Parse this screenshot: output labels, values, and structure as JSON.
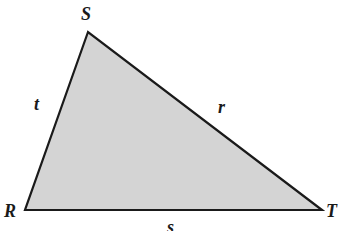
{
  "diagram": {
    "type": "triangle",
    "fill_color": "#d4d4d4",
    "stroke_color": "#1a1a1a",
    "vertices": [
      {
        "name": "S",
        "label": "S"
      },
      {
        "name": "R",
        "label": "R"
      },
      {
        "name": "T",
        "label": "T"
      }
    ],
    "sides": [
      {
        "between": "R-S",
        "label": "t"
      },
      {
        "between": "S-T",
        "label": "r"
      },
      {
        "between": "R-T",
        "label": "s"
      }
    ]
  }
}
